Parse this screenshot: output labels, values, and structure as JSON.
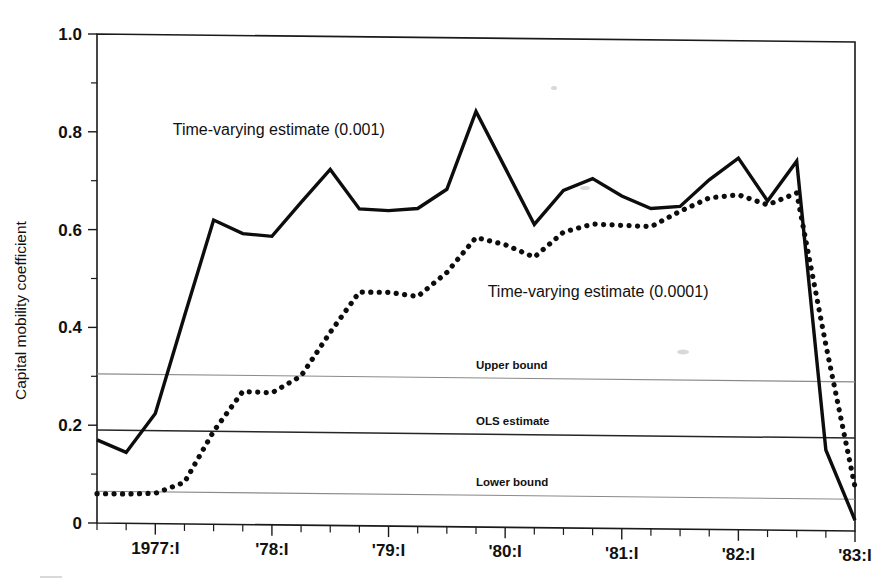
{
  "chart_data": {
    "type": "line",
    "title": "",
    "xlabel": "",
    "ylabel": "Capital mobility coefficient",
    "ylim": [
      0,
      1.0
    ],
    "ytick_labels": [
      "0",
      "0.2",
      "0.4",
      "0.6",
      "0.8",
      "1.0"
    ],
    "ytick_values": [
      0,
      0.2,
      0.4,
      0.6,
      0.8,
      1.0
    ],
    "yminor_values": [
      0.1,
      0.3,
      0.5,
      0.7,
      0.9
    ],
    "xtick_labels": [
      "1977:I",
      "'78:I",
      "'79:I",
      "'80:I",
      "'81:I",
      "'82:I",
      "'83:I"
    ],
    "xtick_values": [
      1977.0,
      1978.0,
      1979.0,
      1980.0,
      1981.0,
      1982.0,
      1983.0
    ],
    "xlim": [
      1976.5,
      1983.0
    ],
    "xminor_step_quarters": 1,
    "grid": false,
    "legend": "inline-annotations",
    "series": [
      {
        "name": "Time-varying estimate (0.001)",
        "style": "solid",
        "x": [
          1976.5,
          1976.75,
          1977.0,
          1977.25,
          1977.5,
          1977.75,
          1978.0,
          1978.25,
          1978.5,
          1978.75,
          1979.0,
          1979.25,
          1979.5,
          1979.75,
          1980.0,
          1980.25,
          1980.5,
          1980.75,
          1981.0,
          1981.25,
          1981.5,
          1981.75,
          1982.0,
          1982.25,
          1982.5,
          1982.75,
          1983.0
        ],
        "values": [
          0.17,
          0.145,
          0.225,
          0.425,
          0.622,
          0.595,
          0.59,
          0.66,
          0.728,
          0.648,
          0.645,
          0.65,
          0.69,
          0.85,
          0.735,
          0.62,
          0.69,
          0.715,
          0.68,
          0.655,
          0.66,
          0.715,
          0.76,
          0.673,
          0.755,
          0.165,
          0.022
        ]
      },
      {
        "name": "Time-varying estimate (0.0001)",
        "style": "dotted",
        "x": [
          1976.5,
          1976.75,
          1977.0,
          1977.25,
          1977.5,
          1977.75,
          1978.0,
          1978.25,
          1978.5,
          1978.75,
          1979.0,
          1979.25,
          1979.5,
          1979.75,
          1980.0,
          1980.25,
          1980.5,
          1980.75,
          1981.0,
          1981.25,
          1981.5,
          1981.75,
          1982.0,
          1982.25,
          1982.5,
          1982.75,
          1983.0
        ],
        "values": [
          0.06,
          0.06,
          0.062,
          0.085,
          0.19,
          0.272,
          0.27,
          0.305,
          0.395,
          0.478,
          0.478,
          0.47,
          0.52,
          0.592,
          0.578,
          0.553,
          0.605,
          0.622,
          0.62,
          0.618,
          0.65,
          0.678,
          0.685,
          0.665,
          0.69,
          0.38,
          0.09
        ]
      }
    ],
    "reference_lines": [
      {
        "name": "Upper bound",
        "label": "Upper bound",
        "value": 0.305,
        "style": "thin-gray"
      },
      {
        "name": "OLS estimate",
        "label": "OLS estimate",
        "value": 0.19,
        "style": "thin-dark"
      },
      {
        "name": "Lower bound",
        "label": "Lower bound",
        "value": 0.065,
        "style": "thin-gray"
      }
    ],
    "annotations": [
      {
        "text": "Time-varying estimate (0.001)",
        "x": 1977.15,
        "y": 0.795
      },
      {
        "text": "Time-varying estimate (0.0001)",
        "x": 1979.85,
        "y": 0.47
      }
    ]
  }
}
